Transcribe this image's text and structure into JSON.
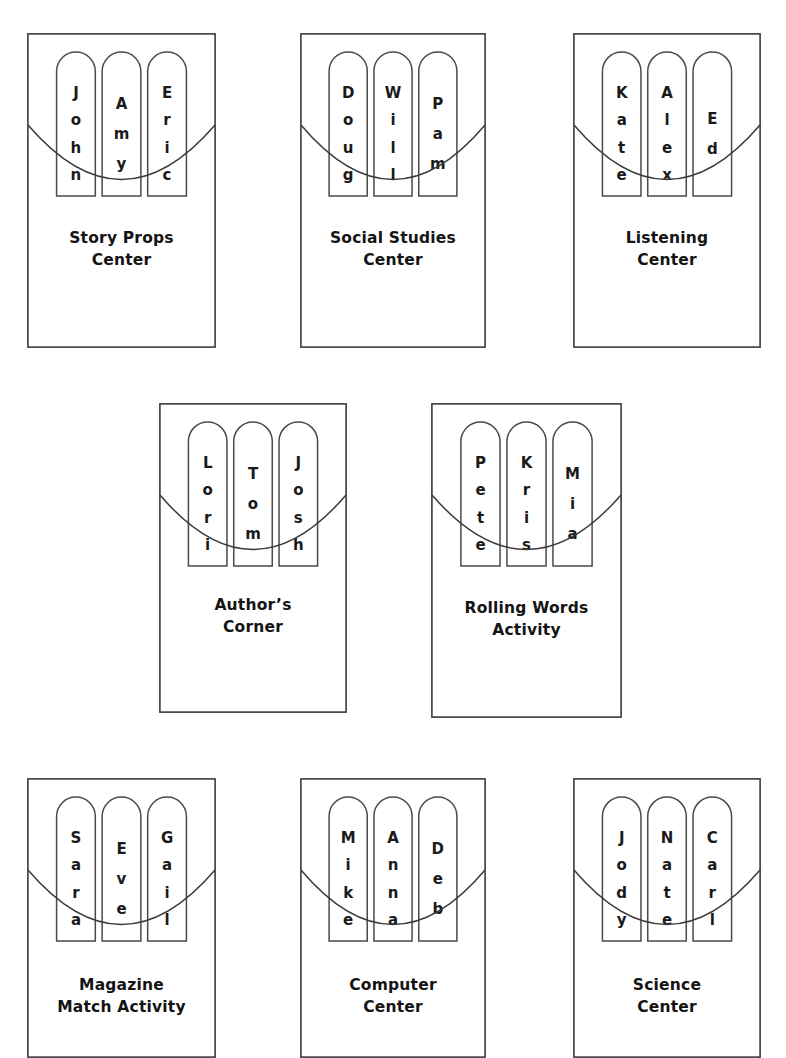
{
  "page": {
    "background_color": "#ffffff",
    "ink_color": "#3b3b3b",
    "stick_count_per_card": 3,
    "artifact_note": "scan speck near top-center"
  },
  "cards": [
    {
      "id": "story-props-center",
      "caption": "Story Props\nCenter",
      "caption_line1": "Story Props",
      "caption_line2": "Center",
      "sticks": [
        {
          "name": "John",
          "letters": [
            "J",
            "o",
            "h",
            "n"
          ]
        },
        {
          "name": "Amy",
          "letters": [
            "A",
            "m",
            "y"
          ]
        },
        {
          "name": "Eric",
          "letters": [
            "E",
            "r",
            "i",
            "c"
          ]
        }
      ],
      "box": {
        "left": 27,
        "top": 33,
        "width": 189,
        "height": 315
      },
      "row": 1
    },
    {
      "id": "social-studies-center",
      "caption": "Social Studies\nCenter",
      "caption_line1": "Social Studies",
      "caption_line2": "Center",
      "sticks": [
        {
          "name": "Doug",
          "letters": [
            "D",
            "o",
            "u",
            "g"
          ]
        },
        {
          "name": "Will",
          "letters": [
            "W",
            "i",
            "l",
            "l"
          ]
        },
        {
          "name": "Pam",
          "letters": [
            "P",
            "a",
            "m"
          ]
        }
      ],
      "box": {
        "left": 300,
        "top": 33,
        "width": 186,
        "height": 315
      },
      "row": 1
    },
    {
      "id": "listening-center",
      "caption": "Listening\nCenter",
      "caption_line1": "Listening",
      "caption_line2": "Center",
      "sticks": [
        {
          "name": "Kate",
          "letters": [
            "K",
            "a",
            "t",
            "e"
          ]
        },
        {
          "name": "Alex",
          "letters": [
            "A",
            "l",
            "e",
            "x"
          ]
        },
        {
          "name": "Ed",
          "letters": [
            "E",
            "d"
          ]
        }
      ],
      "box": {
        "left": 573,
        "top": 33,
        "width": 188,
        "height": 315
      },
      "row": 1
    },
    {
      "id": "authors-corner",
      "caption": "Author’s\nCorner",
      "caption_line1": "Author’s",
      "caption_line2": "Corner",
      "sticks": [
        {
          "name": "Lori",
          "letters": [
            "L",
            "o",
            "r",
            "i"
          ]
        },
        {
          "name": "Tom",
          "letters": [
            "T",
            "o",
            "m"
          ]
        },
        {
          "name": "Josh",
          "letters": [
            "J",
            "o",
            "s",
            "h"
          ]
        }
      ],
      "box": {
        "left": 159,
        "top": 403,
        "width": 188,
        "height": 310
      },
      "row": 2
    },
    {
      "id": "rolling-words-activity",
      "caption": "Rolling Words\nActivity",
      "caption_line1": "Rolling Words",
      "caption_line2": "Activity",
      "sticks": [
        {
          "name": "Pete",
          "letters": [
            "P",
            "e",
            "t",
            "e"
          ]
        },
        {
          "name": "Kris",
          "letters": [
            "K",
            "r",
            "i",
            "s"
          ]
        },
        {
          "name": "Mia",
          "letters": [
            "M",
            "i",
            "a"
          ]
        }
      ],
      "box": {
        "left": 431,
        "top": 403,
        "width": 191,
        "height": 315
      },
      "row": 2
    },
    {
      "id": "magazine-match-activity",
      "caption": "Magazine\nMatch Activity",
      "caption_line1": "Magazine",
      "caption_line2": "Match Activity",
      "sticks": [
        {
          "name": "Sara",
          "letters": [
            "S",
            "a",
            "r",
            "a"
          ]
        },
        {
          "name": "Eve",
          "letters": [
            "E",
            "v",
            "e"
          ]
        },
        {
          "name": "Gail",
          "letters": [
            "G",
            "a",
            "i",
            "l"
          ]
        }
      ],
      "box": {
        "left": 27,
        "top": 778,
        "width": 189,
        "height": 280
      },
      "row": 3
    },
    {
      "id": "computer-center",
      "caption": "Computer\nCenter",
      "caption_line1": "Computer",
      "caption_line2": "Center",
      "sticks": [
        {
          "name": "Mike",
          "letters": [
            "M",
            "i",
            "k",
            "e"
          ]
        },
        {
          "name": "Anna",
          "letters": [
            "A",
            "n",
            "n",
            "a"
          ]
        },
        {
          "name": "Deb",
          "letters": [
            "D",
            "e",
            "b"
          ]
        }
      ],
      "box": {
        "left": 300,
        "top": 778,
        "width": 186,
        "height": 280
      },
      "row": 3
    },
    {
      "id": "science-center",
      "caption": "Science\nCenter",
      "caption_line1": "Science",
      "caption_line2": "Center",
      "sticks": [
        {
          "name": "Jody",
          "letters": [
            "J",
            "o",
            "d",
            "y"
          ]
        },
        {
          "name": "Nate",
          "letters": [
            "N",
            "a",
            "t",
            "e"
          ]
        },
        {
          "name": "Carl",
          "letters": [
            "C",
            "a",
            "r",
            "l"
          ]
        }
      ],
      "box": {
        "left": 573,
        "top": 778,
        "width": 188,
        "height": 280
      },
      "row": 3
    }
  ]
}
